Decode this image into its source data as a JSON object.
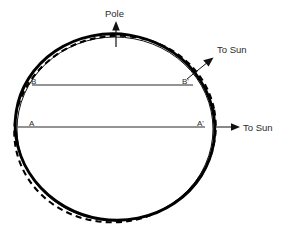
{
  "figure": {
    "title": "",
    "background_color": "#ffffff",
    "width": 289,
    "height": 227,
    "labels": {
      "pole": "Pole",
      "to_sun_upper": "To Sun",
      "to_sun_lower": "To Sun",
      "point_b_left": "B",
      "point_b_right": "B'",
      "point_a_left": "A",
      "point_a_right": "A'"
    },
    "colors": {
      "line": "#111111",
      "curve": "#000000",
      "text": "#2b2b2b",
      "background": "#ffffff"
    },
    "curves": [
      {
        "name": "reference-circle",
        "style": "thin-solid",
        "description": "Thin undeformed reference circle of the Earth"
      },
      {
        "name": "tidal-bulge-solid",
        "style": "thick-solid",
        "description": "Thick solid deformed figure with tidal bulge toward upper-right Sun direction"
      },
      {
        "name": "tidal-bulge-dashed",
        "style": "dashed",
        "description": "Dashed deformed figure with tidal bulge toward lower-right / horizontal Sun direction"
      }
    ],
    "chords": [
      {
        "name": "chord-bb",
        "from": "B",
        "to": "B'",
        "description": "Upper horizontal chord connecting B and B prime"
      },
      {
        "name": "chord-aa",
        "from": "A",
        "to": "A'",
        "description": "Lower horizontal chord connecting A and A prime"
      }
    ],
    "arrows": [
      {
        "name": "pole-arrow",
        "label": "Pole",
        "direction": "up",
        "description": "Vertical arrow pointing to the rotation pole"
      },
      {
        "name": "to-sun-upper-arrow",
        "label": "To Sun",
        "direction": "up-right",
        "description": "Diagonal arrow indicating the Sun direction at an inclined position"
      },
      {
        "name": "to-sun-lower-arrow",
        "label": "To Sun",
        "direction": "right",
        "description": "Horizontal arrow indicating the Sun direction in the equatorial plane"
      }
    ]
  }
}
